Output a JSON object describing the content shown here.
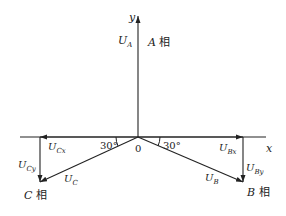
{
  "diagram": {
    "type": "phasor-decomposition",
    "axes": {
      "x_label": "x",
      "y_label": "y",
      "origin_label": "0"
    },
    "phasors": [
      {
        "name": "U_A",
        "label_main": "U",
        "label_sub": "A",
        "phase_label": "A 相",
        "phase_letter": "A",
        "phase_char": "相"
      },
      {
        "name": "U_B",
        "label_main": "U",
        "label_sub": "B",
        "phase_label": "B 相",
        "phase_letter": "B",
        "phase_char": "相",
        "components": [
          {
            "main": "U",
            "sub": "Bx"
          },
          {
            "main": "U",
            "sub": "By"
          }
        ]
      },
      {
        "name": "U_C",
        "label_main": "U",
        "label_sub": "C",
        "phase_label": "C 相",
        "phase_letter": "C",
        "phase_char": "相",
        "components": [
          {
            "main": "U",
            "sub": "Cx"
          },
          {
            "main": "U",
            "sub": "Cy"
          }
        ]
      }
    ],
    "angles": {
      "left": "30°",
      "right": "30°"
    },
    "colors": {
      "stroke": "#222222",
      "background": "#ffffff"
    }
  }
}
